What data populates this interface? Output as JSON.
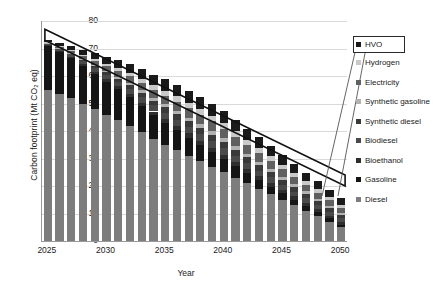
{
  "chart_data": {
    "type": "bar",
    "stacked": true,
    "title": "",
    "xlabel": "Year",
    "ylabel": "Carbon footprint (Mt CO2 eq)",
    "ylabel_display": "Carbon footprint (Mt CO₂ eq)",
    "ylim": [
      0,
      80
    ],
    "ytick_values": [
      0,
      10,
      20,
      30,
      40,
      50,
      60,
      70,
      80
    ],
    "ytick_labels": [
      "0",
      "10",
      "20",
      "30",
      "40",
      "50",
      "60",
      "70",
      "80"
    ],
    "grid": true,
    "grid_axis": "y",
    "legend_position": "right",
    "categories": [
      "2025",
      "2026",
      "2027",
      "2028",
      "2029",
      "2030",
      "2031",
      "2032",
      "2033",
      "2034",
      "2035",
      "2036",
      "2037",
      "2038",
      "2039",
      "2040",
      "2041",
      "2042",
      "2043",
      "2044",
      "2045",
      "2046",
      "2047",
      "2048",
      "2049",
      "2050"
    ],
    "xtick_labels": [
      "2025",
      "2030",
      "2035",
      "2040",
      "2045",
      "2050"
    ],
    "xtick_categories": [
      "2025",
      "2030",
      "2035",
      "2040",
      "2045",
      "2050"
    ],
    "series": [
      {
        "name": "Diesel",
        "color": "#7d7d7d",
        "values": [
          55.0,
          53.5,
          52.0,
          50.0,
          48.0,
          46.0,
          44.0,
          42.0,
          39.5,
          37.0,
          35.0,
          33.0,
          31.0,
          29.0,
          27.0,
          25.0,
          23.0,
          21.0,
          19.0,
          17.0,
          15.0,
          13.0,
          11.0,
          9.0,
          7.0,
          5.0
        ]
      },
      {
        "name": "Gasoline",
        "color": "#151515",
        "values": [
          16.0,
          15.2,
          14.4,
          13.6,
          12.8,
          12.0,
          11.2,
          10.4,
          9.6,
          8.8,
          8.0,
          7.3,
          6.6,
          6.0,
          5.4,
          4.8,
          4.2,
          3.6,
          3.1,
          2.7,
          2.3,
          2.0,
          1.7,
          1.4,
          1.2,
          1.0
        ]
      },
      {
        "name": "Bioethanol",
        "color": "#2e2e2e",
        "values": [
          0.4,
          0.5,
          0.6,
          0.7,
          0.8,
          0.9,
          1.0,
          1.1,
          1.2,
          1.3,
          1.4,
          1.4,
          1.5,
          1.5,
          1.6,
          1.6,
          1.6,
          1.6,
          1.5,
          1.5,
          1.4,
          1.3,
          1.2,
          1.1,
          1.0,
          0.9
        ]
      },
      {
        "name": "Biodiesel",
        "color": "#4a4a4a",
        "values": [
          0.5,
          0.7,
          0.9,
          1.1,
          1.3,
          1.5,
          1.7,
          1.9,
          2.1,
          2.2,
          2.3,
          2.4,
          2.4,
          2.4,
          2.4,
          2.3,
          2.2,
          2.1,
          2.0,
          1.9,
          1.8,
          1.7,
          1.6,
          1.5,
          1.4,
          1.3
        ]
      },
      {
        "name": "Synthetic diesel",
        "color": "#3a3a3a",
        "values": [
          0.1,
          0.2,
          0.3,
          0.5,
          0.7,
          0.9,
          1.1,
          1.3,
          1.5,
          1.7,
          1.9,
          2.0,
          2.1,
          2.2,
          2.2,
          2.2,
          2.2,
          2.1,
          2.0,
          1.9,
          1.8,
          1.7,
          1.6,
          1.5,
          1.4,
          1.3
        ]
      },
      {
        "name": "Synthetic gasoline",
        "color": "#b2b2b2",
        "values": [
          0.1,
          0.2,
          0.3,
          0.4,
          0.5,
          0.6,
          0.8,
          0.9,
          1.0,
          1.1,
          1.2,
          1.3,
          1.3,
          1.4,
          1.4,
          1.4,
          1.4,
          1.3,
          1.3,
          1.2,
          1.1,
          1.1,
          1.0,
          0.9,
          0.9,
          0.8
        ]
      },
      {
        "name": "Electricity",
        "color": "#606060",
        "values": [
          0.3,
          0.5,
          0.8,
          1.1,
          1.4,
          1.7,
          2.0,
          2.3,
          2.6,
          2.9,
          3.1,
          3.3,
          3.4,
          3.5,
          3.5,
          3.5,
          3.4,
          3.3,
          3.2,
          3.0,
          2.8,
          2.6,
          2.4,
          2.2,
          2.0,
          1.8
        ]
      },
      {
        "name": "Hydrogen",
        "color": "#c9c9c9",
        "values": [
          0.1,
          0.2,
          0.3,
          0.4,
          0.6,
          0.8,
          1.0,
          1.2,
          1.4,
          1.6,
          1.8,
          1.9,
          2.0,
          2.1,
          2.1,
          2.1,
          2.0,
          1.9,
          1.8,
          1.7,
          1.6,
          1.5,
          1.4,
          1.3,
          1.2,
          1.1
        ]
      },
      {
        "name": "HVO",
        "color": "#1a1a1a",
        "values": [
          0.5,
          1.0,
          1.4,
          1.8,
          2.2,
          2.6,
          3.0,
          3.3,
          3.6,
          3.9,
          4.1,
          4.2,
          4.3,
          4.3,
          4.3,
          4.2,
          4.1,
          4.0,
          3.8,
          3.6,
          3.4,
          3.2,
          3.0,
          2.8,
          2.6,
          2.4
        ]
      }
    ],
    "totals": [
      73.0,
      72.0,
      71.0,
      69.6,
      68.3,
      67.0,
      65.8,
      64.4,
      62.5,
      60.5,
      58.8,
      56.8,
      54.6,
      52.4,
      49.9,
      47.1,
      44.1,
      40.9,
      37.7,
      34.5,
      31.2,
      28.1,
      24.9,
      21.7,
      18.7,
      15.6
    ],
    "annotation": {
      "type": "tapering-arrow-outline",
      "description": "Black outlined wedge from 2025 high to 2050 low indicating declining trend",
      "start_year": "2025",
      "start_upper": 77.0,
      "start_lower": 73.0,
      "end_year": "2050",
      "end_upper": 24.0,
      "end_lower": 20.0
    },
    "callout": {
      "target_series": "HVO",
      "boxed_legend_entry": "HVO"
    }
  },
  "legend": {
    "items": [
      {
        "label": "HVO",
        "color": "#1a1a1a",
        "boxed": true
      },
      {
        "label": "Hydrogen",
        "color": "#c9c9c9",
        "boxed": false
      },
      {
        "label": "Electricity",
        "color": "#606060",
        "boxed": false
      },
      {
        "label": "Synthetic gasoline",
        "color": "#b2b2b2",
        "boxed": false
      },
      {
        "label": "Synthetic diesel",
        "color": "#3a3a3a",
        "boxed": false
      },
      {
        "label": "Biodiesel",
        "color": "#4a4a4a",
        "boxed": false
      },
      {
        "label": "Bioethanol",
        "color": "#2e2e2e",
        "boxed": false
      },
      {
        "label": "Gasoline",
        "color": "#151515",
        "boxed": false
      },
      {
        "label": "Diesel",
        "color": "#7d7d7d",
        "boxed": false
      }
    ]
  }
}
